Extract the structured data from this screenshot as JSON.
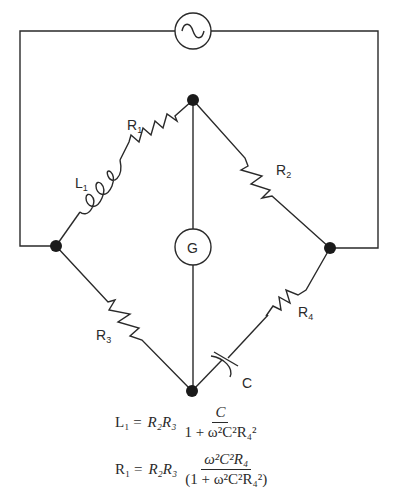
{
  "diagram": {
    "source": {
      "symbol": "ac-source",
      "glyph": "~"
    },
    "detector": {
      "label": "G"
    },
    "components": [
      {
        "id": "R1",
        "label": "R",
        "subscript": "1",
        "type": "resistor",
        "branch": "left-top"
      },
      {
        "id": "L1",
        "label": "L",
        "subscript": "1",
        "type": "inductor",
        "branch": "left-top"
      },
      {
        "id": "R2",
        "label": "R",
        "subscript": "2",
        "type": "resistor",
        "branch": "right-top"
      },
      {
        "id": "R3",
        "label": "R",
        "subscript": "3",
        "type": "resistor",
        "branch": "left-bottom"
      },
      {
        "id": "R4",
        "label": "R",
        "subscript": "4",
        "type": "resistor",
        "branch": "right-bottom"
      },
      {
        "id": "C",
        "label": "C",
        "subscript": "",
        "type": "capacitor",
        "branch": "right-bottom"
      }
    ],
    "labels": {
      "r1": "R",
      "r1_sub": "1",
      "l1": "L",
      "l1_sub": "1",
      "r2": "R",
      "r2_sub": "2",
      "r3": "R",
      "r3_sub": "3",
      "r4": "R",
      "r4_sub": "4",
      "c": "C",
      "g": "G"
    },
    "equations": [
      {
        "lhs": "L₁ =",
        "factor": "R₂R₃",
        "numerator": "C",
        "denominator": "1 + ω²C²R₄²"
      },
      {
        "lhs": "R₁ =",
        "factor": "R₂R₃",
        "numerator": "ω²C²R₄",
        "denominator": "(1 + ω²C²R₄²)"
      }
    ],
    "colors": {
      "line": "#2a2a2a",
      "node": "#1a1a1a",
      "background": "#ffffff"
    }
  }
}
